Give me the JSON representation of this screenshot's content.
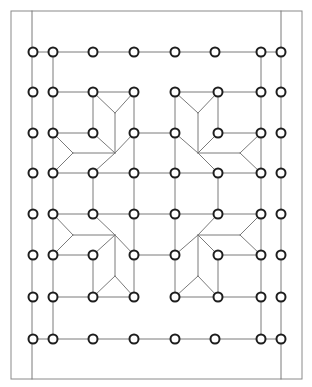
{
  "diagram": {
    "title": "",
    "colors": {
      "background": "#ffffff",
      "frame": "#8a8a8a",
      "edge": "#7a7a7a",
      "node_stroke": "#1e1e1e",
      "node_fill": "#ffffff"
    },
    "frame": {
      "x": 11,
      "y": 11,
      "width": 291,
      "height": 368
    },
    "node_radius": 4.5,
    "columns": [
      33,
      53,
      93,
      134,
      175,
      218,
      261,
      281
    ],
    "rows": [
      52,
      92,
      133,
      173,
      214,
      255,
      297,
      339
    ],
    "nodes": [
      [
        33,
        52
      ],
      [
        53,
        52
      ],
      [
        93,
        52
      ],
      [
        134,
        52
      ],
      [
        175,
        52
      ],
      [
        215,
        52
      ],
      [
        261,
        52
      ],
      [
        281,
        52
      ],
      [
        33,
        92
      ],
      [
        53,
        92
      ],
      [
        93,
        92
      ],
      [
        134,
        92
      ],
      [
        175,
        92
      ],
      [
        218,
        92
      ],
      [
        261,
        92
      ],
      [
        281,
        92
      ],
      [
        33,
        133
      ],
      [
        53,
        133
      ],
      [
        93,
        133
      ],
      [
        134,
        133
      ],
      [
        175,
        133
      ],
      [
        218,
        133
      ],
      [
        261,
        133
      ],
      [
        281,
        133
      ],
      [
        33,
        173
      ],
      [
        53,
        173
      ],
      [
        93,
        173
      ],
      [
        134,
        173
      ],
      [
        175,
        173
      ],
      [
        218,
        173
      ],
      [
        261,
        173
      ],
      [
        281,
        173
      ],
      [
        33,
        214
      ],
      [
        53,
        214
      ],
      [
        93,
        214
      ],
      [
        134,
        214
      ],
      [
        175,
        214
      ],
      [
        218,
        214
      ],
      [
        261,
        214
      ],
      [
        281,
        214
      ],
      [
        33,
        255
      ],
      [
        53,
        255
      ],
      [
        93,
        255
      ],
      [
        134,
        255
      ],
      [
        175,
        255
      ],
      [
        218,
        255
      ],
      [
        261,
        255
      ],
      [
        281,
        255
      ],
      [
        33,
        297
      ],
      [
        53,
        297
      ],
      [
        93,
        297
      ],
      [
        134,
        297
      ],
      [
        175,
        297
      ],
      [
        218,
        297
      ],
      [
        261,
        297
      ],
      [
        281,
        297
      ],
      [
        33,
        339
      ],
      [
        53,
        339
      ],
      [
        93,
        339
      ],
      [
        134,
        339
      ],
      [
        175,
        339
      ],
      [
        215,
        339
      ],
      [
        261,
        339
      ],
      [
        281,
        339
      ]
    ],
    "edges": [
      [
        32,
        11,
        32,
        379
      ],
      [
        281,
        11,
        281,
        379
      ],
      [
        33,
        52,
        281,
        52
      ],
      [
        33,
        339,
        281,
        339
      ],
      [
        53,
        52,
        53,
        339
      ],
      [
        261,
        52,
        261,
        339
      ],
      [
        53,
        92,
        134,
        92
      ],
      [
        175,
        92,
        261,
        92
      ],
      [
        53,
        297,
        134,
        297
      ],
      [
        175,
        297,
        261,
        297
      ],
      [
        134,
        92,
        134,
        297
      ],
      [
        175,
        92,
        175,
        297
      ],
      [
        93,
        92,
        93,
        133
      ],
      [
        218,
        92,
        218,
        133
      ],
      [
        93,
        255,
        93,
        297
      ],
      [
        218,
        255,
        218,
        297
      ],
      [
        53,
        133,
        93,
        133
      ],
      [
        134,
        133,
        175,
        133
      ],
      [
        218,
        133,
        261,
        133
      ],
      [
        53,
        173,
        261,
        173
      ],
      [
        53,
        214,
        261,
        214
      ],
      [
        93,
        173,
        93,
        214
      ],
      [
        218,
        173,
        218,
        214
      ],
      [
        53,
        255,
        93,
        255
      ],
      [
        134,
        255,
        175,
        255
      ],
      [
        218,
        255,
        261,
        255
      ],
      [
        93,
        92,
        115,
        113
      ],
      [
        134,
        92,
        115,
        113
      ],
      [
        115,
        113,
        115,
        153
      ],
      [
        53,
        133,
        73,
        153
      ],
      [
        73,
        153,
        53,
        173
      ],
      [
        73,
        153,
        115,
        153
      ],
      [
        93,
        133,
        115,
        153
      ],
      [
        134,
        133,
        115,
        153
      ],
      [
        115,
        153,
        93,
        173
      ],
      [
        175,
        92,
        198,
        113
      ],
      [
        218,
        92,
        198,
        113
      ],
      [
        198,
        113,
        198,
        153
      ],
      [
        175,
        133,
        198,
        153
      ],
      [
        218,
        133,
        198,
        153
      ],
      [
        198,
        153,
        240,
        153
      ],
      [
        240,
        153,
        261,
        133
      ],
      [
        240,
        153,
        261,
        173
      ],
      [
        198,
        153,
        218,
        173
      ],
      [
        53,
        214,
        73,
        235
      ],
      [
        73,
        235,
        53,
        255
      ],
      [
        73,
        235,
        115,
        235
      ],
      [
        93,
        214,
        115,
        235
      ],
      [
        115,
        235,
        134,
        255
      ],
      [
        115,
        235,
        93,
        255
      ],
      [
        115,
        235,
        115,
        276
      ],
      [
        115,
        276,
        93,
        297
      ],
      [
        115,
        276,
        134,
        297
      ],
      [
        218,
        214,
        198,
        235
      ],
      [
        198,
        235,
        240,
        235
      ],
      [
        240,
        235,
        261,
        214
      ],
      [
        240,
        235,
        261,
        255
      ],
      [
        198,
        235,
        175,
        255
      ],
      [
        198,
        235,
        218,
        255
      ],
      [
        198,
        235,
        198,
        276
      ],
      [
        198,
        276,
        175,
        297
      ],
      [
        198,
        276,
        218,
        297
      ]
    ]
  }
}
